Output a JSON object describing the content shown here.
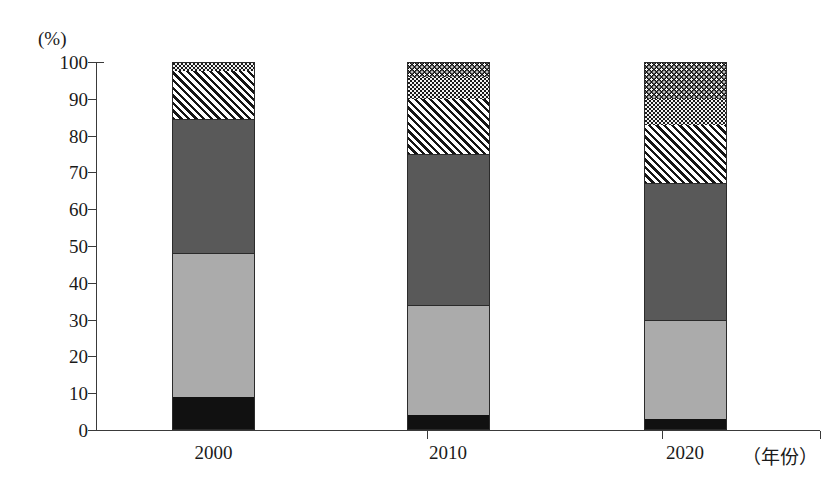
{
  "chart_data": {
    "type": "bar",
    "subtype": "stacked-100-percent",
    "title": "",
    "xlabel": "（年份）",
    "ylabel": "(%)",
    "ylim": [
      0,
      100
    ],
    "ytick_step": 10,
    "yticks": [
      "100",
      "90",
      "80",
      "70",
      "60",
      "50",
      "40",
      "30",
      "20",
      "10",
      "0"
    ],
    "categories": [
      "2000",
      "2010",
      "2020"
    ],
    "grid": false,
    "legend": "none",
    "series": [
      {
        "name": "segment-1-black",
        "pattern": "solid-black",
        "color": "#111111",
        "values": [
          9,
          4,
          3
        ]
      },
      {
        "name": "segment-2-light-gray",
        "pattern": "solid-light-gray",
        "color": "#ababab",
        "values": [
          39,
          30,
          27
        ]
      },
      {
        "name": "segment-3-dark-gray",
        "pattern": "solid-dark-gray",
        "color": "#595959",
        "values": [
          36.5,
          41,
          37
        ]
      },
      {
        "name": "segment-4-hatch",
        "pattern": "diagonal-hatch",
        "color": "#ffffff",
        "values": [
          13,
          15,
          16
        ]
      },
      {
        "name": "segment-5-light-dots",
        "pattern": "light-stipple",
        "color": "#f2f2f2",
        "values": [
          2.5,
          6,
          7
        ]
      },
      {
        "name": "segment-6-dark-dots",
        "pattern": "dark-stipple",
        "color": "#111111",
        "values": [
          0,
          4,
          10
        ]
      }
    ],
    "cumulative_boundaries": {
      "2000": [
        0,
        9,
        48,
        84.5,
        97.5,
        100,
        100
      ],
      "2010": [
        0,
        4,
        34,
        75,
        90,
        96,
        100
      ],
      "2020": [
        0,
        3,
        30,
        67,
        83,
        90,
        100
      ]
    }
  },
  "axis": {
    "unit_label": "(%)",
    "x_title": "（年份）"
  }
}
